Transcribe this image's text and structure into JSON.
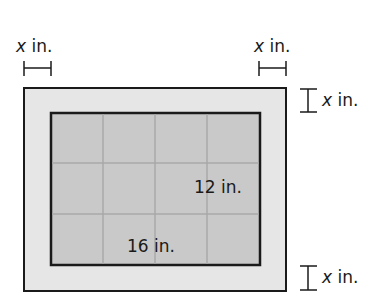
{
  "figure": {
    "colors": {
      "background": "#ffffff",
      "frame_fill": "#e6e6e6",
      "picture_fill": "#c9c9c9",
      "grid_line": "#a8a8a8",
      "outline": "#1a1a1a"
    },
    "outer_rect": {
      "x": 24,
      "y": 88,
      "width": 262,
      "height": 203
    },
    "inner_rect": {
      "x": 51,
      "y": 113,
      "width": 209,
      "height": 152
    },
    "grid": {
      "columns": 4,
      "rows": 3
    },
    "labels": {
      "top_left": {
        "variable": "x",
        "unit": " in."
      },
      "top_right": {
        "variable": "x",
        "unit": " in."
      },
      "right_top": {
        "variable": "x",
        "unit": " in."
      },
      "right_bottom": {
        "variable": "x",
        "unit": " in."
      },
      "inner_height": "12 in.",
      "inner_width": "16 in."
    }
  }
}
